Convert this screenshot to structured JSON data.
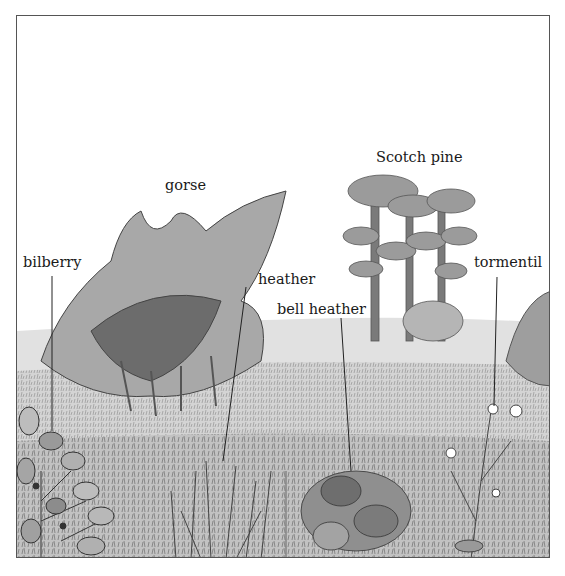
{
  "diagram": {
    "labels": [
      {
        "id": "gorse",
        "text": "gorse"
      },
      {
        "id": "scotch-pine",
        "text": "Scotch pine"
      },
      {
        "id": "bilberry",
        "text": "bilberry"
      },
      {
        "id": "heather",
        "text": "heather"
      },
      {
        "id": "bell-heather",
        "text": "bell heather"
      },
      {
        "id": "tormentil",
        "text": "tormentil"
      }
    ]
  }
}
